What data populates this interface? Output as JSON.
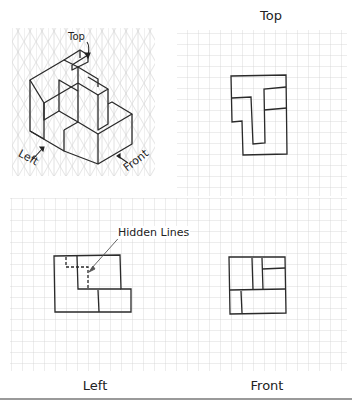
{
  "isometric": {
    "labels": {
      "top": "Top",
      "left": "Left",
      "front": "Front"
    }
  },
  "views": {
    "top": {
      "label": "Top"
    },
    "left": {
      "label": "Left",
      "annotation": "Hidden Lines"
    },
    "front": {
      "label": "Front"
    }
  },
  "grid": {
    "cell_px": 11,
    "line_color": "#d4d4d4",
    "stroke_color": "#2a2a2a"
  }
}
